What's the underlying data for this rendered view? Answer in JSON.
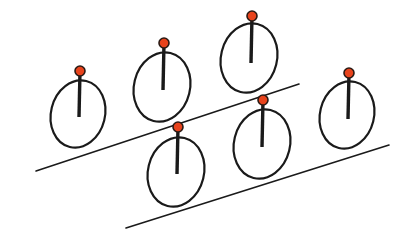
{
  "diagram": {
    "colors": {
      "background": "#ffffff",
      "line": "#1a1a1a",
      "marker": "#e8431c"
    },
    "inclines": [
      {
        "id": "upper",
        "x1": 36,
        "y1": 171,
        "x2": 299,
        "y2": 84
      },
      {
        "id": "lower",
        "x1": 126,
        "y1": 228,
        "x2": 389,
        "y2": 145
      }
    ],
    "wheels": [
      {
        "id": "wheel-1",
        "incline": "upper",
        "cx": 78,
        "cy": 114,
        "rx": 27,
        "ry": 34,
        "rot": 14,
        "pin_x": 80,
        "pin_y": 71,
        "rod_end_y": 117
      },
      {
        "id": "wheel-2",
        "incline": "upper",
        "cx": 162,
        "cy": 87,
        "rx": 28,
        "ry": 35,
        "rot": 14,
        "pin_x": 164,
        "pin_y": 43,
        "rod_end_y": 90
      },
      {
        "id": "wheel-3",
        "incline": "upper",
        "cx": 249,
        "cy": 58,
        "rx": 28,
        "ry": 35,
        "rot": 14,
        "pin_x": 252,
        "pin_y": 16,
        "rod_end_y": 63
      },
      {
        "id": "wheel-4",
        "incline": "lower",
        "cx": 176,
        "cy": 172,
        "rx": 28,
        "ry": 35,
        "rot": 14,
        "pin_x": 178,
        "pin_y": 127,
        "rod_end_y": 174
      },
      {
        "id": "wheel-5",
        "incline": "lower",
        "cx": 262,
        "cy": 144,
        "rx": 28,
        "ry": 35,
        "rot": 14,
        "pin_x": 263,
        "pin_y": 100,
        "rod_end_y": 147
      },
      {
        "id": "wheel-6",
        "incline": "lower",
        "cx": 347,
        "cy": 115,
        "rx": 27,
        "ry": 34,
        "rot": 14,
        "pin_x": 349,
        "pin_y": 73,
        "rod_end_y": 119
      }
    ]
  }
}
